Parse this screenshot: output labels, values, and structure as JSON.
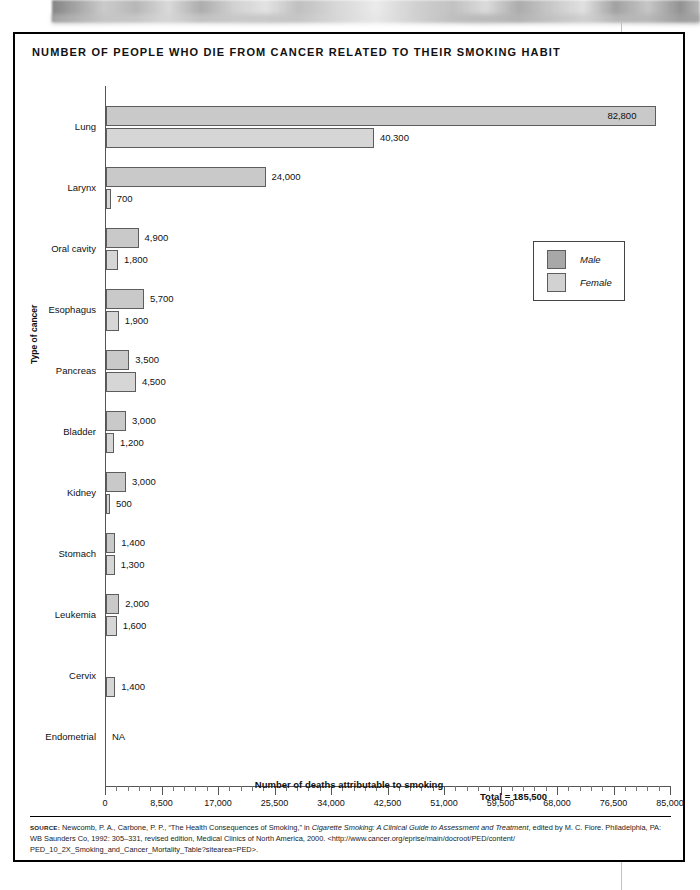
{
  "figure": {
    "title": "NUMBER OF PEOPLE WHO DIE FROM CANCER RELATED TO THEIR SMOKING HABIT",
    "total_label": "Total = 185,500",
    "na_text": "NA"
  },
  "legend": {
    "position": "right-upper",
    "entries": [
      {
        "label": "Male",
        "color": "#a8a8a8"
      },
      {
        "label": "Female",
        "color": "#d2d2d2"
      }
    ]
  },
  "source": {
    "prefix": "source:",
    "line1_a": " Newcomb, P. A., Carbone, P. P., “The Health Consequences of Smoking,” in ",
    "line1_italic": "Cigarette Smoking: A Clinical Guide to Assessment and Treatment",
    "line1_b": ", edited by M. C. Fiore.",
    "line2": "Philadelphia, PA: WB Saunders Co, 1992: 305–331, revised edition, Medical Clinics of North America, 2000. <http://www.cancer.org/eprise/main/docroot/PED/content/",
    "line3": "PED_10_2X_Smoking_and_Cancer_Mortality_Table?sitearea=PED>."
  },
  "chart_data": {
    "type": "bar",
    "orientation": "horizontal",
    "title": "NUMBER OF PEOPLE WHO DIE FROM CANCER RELATED TO THEIR SMOKING HABIT",
    "xlabel": "Number of deaths attributable to smoking",
    "ylabel": "Type of cancer",
    "xlim": [
      0,
      85000
    ],
    "xticks": [
      0,
      8500,
      17000,
      25500,
      34000,
      42500,
      51000,
      59500,
      68000,
      76500,
      85000
    ],
    "xtick_labels": [
      "0",
      "8,500",
      "17,000",
      "25,500",
      "34,000",
      "42,500",
      "51,000",
      "59,500",
      "68,000",
      "76,500",
      "85,000"
    ],
    "minor_tick_step": 1700,
    "grid": false,
    "legend": [
      "Male",
      "Female"
    ],
    "categories": [
      "Lung",
      "Larynx",
      "Oral cavity",
      "Esophagus",
      "Pancreas",
      "Bladder",
      "Kidney",
      "Stomach",
      "Leukemia",
      "Cervix",
      "Endometrial"
    ],
    "series": [
      {
        "name": "Male",
        "values": [
          82800,
          24000,
          4900,
          5700,
          3500,
          3000,
          3000,
          1400,
          2000,
          null,
          null
        ],
        "labels": [
          "82,800",
          "24,000",
          "4,900",
          "5,700",
          "3,500",
          "3,000",
          "3,000",
          "1,400",
          "2,000",
          "",
          ""
        ]
      },
      {
        "name": "Female",
        "values": [
          40300,
          700,
          1800,
          1900,
          4500,
          1200,
          500,
          1300,
          1600,
          1400,
          null
        ],
        "labels": [
          "40,300",
          "700",
          "1,800",
          "1,900",
          "4,500",
          "1,200",
          "500",
          "1,300",
          "1,600",
          "1,400",
          "NA"
        ]
      }
    ],
    "total": 185500
  }
}
